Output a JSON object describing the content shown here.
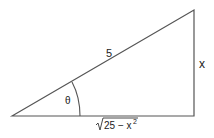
{
  "diagram": {
    "type": "right-triangle",
    "hypotenuse_label": "5",
    "opposite_label": "x",
    "adjacent_label_radicand": "25 − x",
    "adjacent_label_exponent": "2",
    "angle_label": "θ",
    "colors": {
      "stroke": "#555555",
      "text": "#222222",
      "background": "#ffffff"
    }
  }
}
